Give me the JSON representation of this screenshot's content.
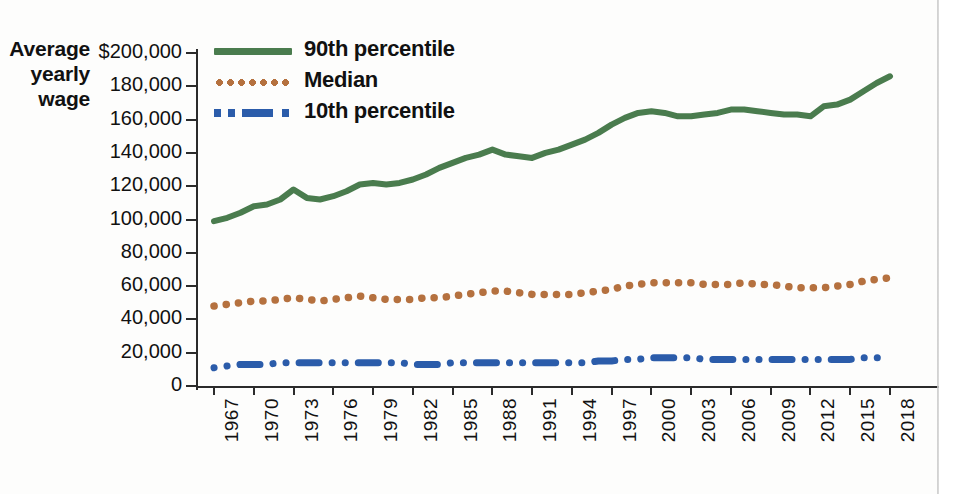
{
  "figure": {
    "axis_title_lines": [
      "Average",
      "yearly",
      "wage"
    ],
    "colors": {
      "p90": "#4a7c4e",
      "median": "#b5713f",
      "p10": "#2b5caa",
      "axis": "#2b2b2b",
      "text": "#111111",
      "background": "#fdfdfc"
    }
  },
  "legend": {
    "position": "top-left-inside",
    "items": [
      {
        "label": "90th percentile",
        "color": "#4a7c4e",
        "style": "solid",
        "swatch_name": "legend-swatch-p90"
      },
      {
        "label": "Median",
        "color": "#b5713f",
        "style": "dotted",
        "swatch_name": "legend-swatch-median"
      },
      {
        "label": "10th percentile",
        "color": "#2b5caa",
        "style": "dashdot",
        "swatch_name": "legend-swatch-p10"
      }
    ]
  },
  "chart_data": {
    "type": "line",
    "title": "",
    "subtitle": "",
    "xlabel": "",
    "ylabel": "Average yearly wage",
    "ylim": [
      0,
      200000
    ],
    "ytick_labels": [
      "$200,000",
      "180,000",
      "160,000",
      "140,000",
      "120,000",
      "100,000",
      "80,000",
      "60,000",
      "40,000",
      "20,000",
      "0"
    ],
    "ytick_values": [
      200000,
      180000,
      160000,
      140000,
      120000,
      100000,
      80000,
      60000,
      40000,
      20000,
      0
    ],
    "grid": false,
    "xlim": [
      1967,
      2018
    ],
    "xtick_labels": [
      "1967",
      "1970",
      "1973",
      "1976",
      "1979",
      "1982",
      "1985",
      "1988",
      "1991",
      "1994",
      "1997",
      "2000",
      "2003",
      "2006",
      "2009",
      "2012",
      "2015",
      "2018"
    ],
    "xtick_values": [
      1967,
      1970,
      1973,
      1976,
      1979,
      1982,
      1985,
      1988,
      1991,
      1994,
      1997,
      2000,
      2003,
      2006,
      2009,
      2012,
      2015,
      2018
    ],
    "x": [
      1967,
      1968,
      1969,
      1970,
      1971,
      1972,
      1973,
      1974,
      1975,
      1976,
      1977,
      1978,
      1979,
      1980,
      1981,
      1982,
      1983,
      1984,
      1985,
      1986,
      1987,
      1988,
      1989,
      1990,
      1991,
      1992,
      1993,
      1994,
      1995,
      1996,
      1997,
      1998,
      1999,
      2000,
      2001,
      2002,
      2003,
      2004,
      2005,
      2006,
      2007,
      2008,
      2009,
      2010,
      2011,
      2012,
      2013,
      2014,
      2015,
      2016,
      2017,
      2018
    ],
    "series": [
      {
        "name": "90th percentile",
        "color": "#4a7c4e",
        "style": "solid",
        "values": [
          99000,
          101000,
          104000,
          108000,
          109000,
          112000,
          118000,
          113000,
          112000,
          114000,
          117000,
          121000,
          122000,
          121000,
          122000,
          124000,
          127000,
          131000,
          134000,
          137000,
          139000,
          142000,
          139000,
          138000,
          137000,
          140000,
          142000,
          145000,
          148000,
          152000,
          157000,
          161000,
          164000,
          165000,
          164000,
          162000,
          162000,
          163000,
          164000,
          166000,
          166000,
          165000,
          164000,
          163000,
          163000,
          162000,
          168000,
          169000,
          172000,
          177000,
          182000,
          186000
        ]
      },
      {
        "name": "Median",
        "color": "#b5713f",
        "style": "dotted",
        "values": [
          48000,
          49000,
          50000,
          51000,
          51000,
          52000,
          53000,
          52000,
          51000,
          52000,
          53000,
          54000,
          53000,
          52000,
          52000,
          52000,
          53000,
          53000,
          54000,
          55000,
          56000,
          57000,
          57000,
          56000,
          55000,
          55000,
          55000,
          55000,
          56000,
          57000,
          58000,
          60000,
          61000,
          62000,
          62000,
          62000,
          62000,
          61000,
          61000,
          61000,
          62000,
          61000,
          61000,
          60000,
          59000,
          59000,
          59000,
          60000,
          61000,
          63000,
          64000,
          65000
        ]
      },
      {
        "name": "10th percentile",
        "color": "#2b5caa",
        "style": "dashdot",
        "values": [
          11000,
          12000,
          13000,
          13000,
          13000,
          14000,
          14000,
          14000,
          14000,
          14000,
          14000,
          14000,
          14000,
          14000,
          14000,
          13000,
          13000,
          13000,
          14000,
          14000,
          14000,
          14000,
          14000,
          14000,
          14000,
          14000,
          14000,
          14000,
          14000,
          15000,
          15000,
          16000,
          16000,
          17000,
          17000,
          17000,
          17000,
          16000,
          16000,
          16000,
          16000,
          16000,
          16000,
          16000,
          16000,
          16000,
          16000,
          16000,
          16000,
          17000,
          17000,
          17000
        ]
      }
    ]
  }
}
